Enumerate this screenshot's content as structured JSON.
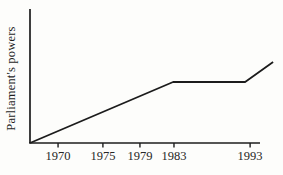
{
  "chart_data": {
    "type": "line",
    "title": "",
    "xlabel": "",
    "ylabel": "Parliament's powers",
    "x_tick_labels": [
      "1970",
      "1975",
      "1979",
      "1983",
      "1993"
    ],
    "y_tick_labels": [],
    "grid": false,
    "legend": false,
    "x_tick_pos_frac": [
      0.122,
      0.317,
      0.478,
      0.626,
      0.957
    ],
    "series": [
      {
        "name": "parliaments-powers-trend",
        "points_frac": [
          [
            0.0,
            0.0
          ],
          [
            0.622,
            0.455
          ],
          [
            0.935,
            0.455
          ],
          [
            1.057,
            0.604
          ]
        ],
        "reading": "Steady rise from before 1970 until 1983, constant plateau from 1983 until just before 1993, then rising again after 1993."
      }
    ],
    "colors": {
      "line": "#1c1c1c",
      "axis": "#1c1c1c",
      "text": "#262626",
      "background": "#fdfdfb"
    }
  }
}
